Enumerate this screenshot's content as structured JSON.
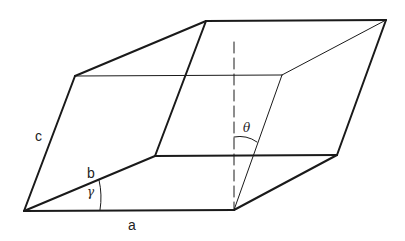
{
  "diagram": {
    "labels": {
      "a": "a",
      "b": "b",
      "c": "c",
      "gamma": "γ",
      "theta": "θ"
    },
    "colors": {
      "stroke": "#1a1a1a",
      "background": "#ffffff"
    }
  }
}
